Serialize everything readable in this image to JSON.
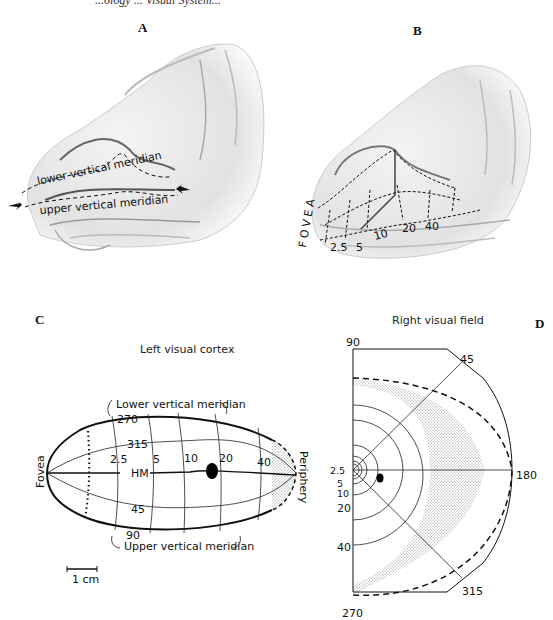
{
  "header": {
    "cutoff_text": "...ology ... Visual System..."
  },
  "panels": {
    "A": {
      "letter": "A",
      "labels": {
        "lower": "lower vertical meridian",
        "upper": "upper vertical meridian"
      }
    },
    "B": {
      "letter": "B",
      "fovea": "FOVEA",
      "eccentricities": [
        "2.5",
        "5",
        "10",
        "20",
        "40"
      ]
    },
    "C": {
      "letter": "C",
      "title": "Left visual cortex",
      "fovea": "Fovea",
      "periphery": "Periphery",
      "lower_meridian": "Lower vertical meridian",
      "upper_meridian": "Upper vertical meridian",
      "angles": {
        "a270": "270",
        "a315": "315",
        "hm": "HM",
        "a45": "45",
        "a90": "90"
      },
      "eccentricities": [
        "2.5",
        "5",
        "10",
        "20",
        "40"
      ],
      "scale_bar": "1 cm"
    },
    "D": {
      "letter": "D",
      "title": "Right visual field",
      "angles": {
        "a90": "90",
        "a45": "45",
        "a180": "180",
        "a315": "315",
        "a270": "270"
      },
      "eccentricities": [
        "2.5",
        "5",
        "10",
        "20",
        "40"
      ]
    }
  }
}
